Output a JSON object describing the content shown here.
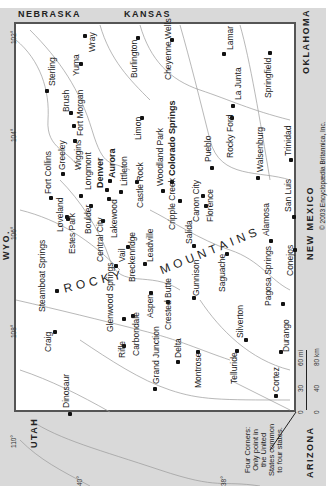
{
  "map": {
    "title": "Colorado",
    "orientation": "rotated 90° counter-clockwise (north at left)",
    "neighbors": {
      "nebraska": "NEBRASKA",
      "kansas": "KANSAS",
      "oklahoma": "OKLAHOMA",
      "new_mexico": "NEW MEXICO",
      "arizona": "ARIZONA",
      "utah": "UTAH",
      "wyoming": "WYO."
    },
    "mountain_range": {
      "word1": "ROCKY",
      "word2": "MOUNTAINS"
    },
    "longitude_ticks": [
      "102°",
      "104°",
      "106°",
      "108°",
      "110°"
    ],
    "latitude_ticks": [
      "38°",
      "40°"
    ],
    "copyright": "© 2003 Encyclopædia Britannica, Inc.",
    "four_corners_note": "Four Corners:\nOnly point in\nthe United\nStates common\nto four states.",
    "scale": {
      "mi_labels": [
        "0",
        "30",
        "60 mi"
      ],
      "km_labels": [
        "0",
        "40",
        "80 km"
      ]
    },
    "cities": [
      {
        "name": "Wray"
      },
      {
        "name": "Yuma"
      },
      {
        "name": "Sterling"
      },
      {
        "name": "Brush"
      },
      {
        "name": "Fort Morgan"
      },
      {
        "name": "Burlington"
      },
      {
        "name": "Cheyenne Wells"
      },
      {
        "name": "Lamar"
      },
      {
        "name": "Springfield"
      },
      {
        "name": "La Junta"
      },
      {
        "name": "Rocky Ford"
      },
      {
        "name": "Trinidad"
      },
      {
        "name": "Walsenburg"
      },
      {
        "name": "Limon"
      },
      {
        "name": "Fort Collins"
      },
      {
        "name": "Greeley"
      },
      {
        "name": "Wiggins"
      },
      {
        "name": "Longmont"
      },
      {
        "name": "Denver"
      },
      {
        "name": "Aurora"
      },
      {
        "name": "Littleton"
      },
      {
        "name": "Loveland"
      },
      {
        "name": "Estes Park"
      },
      {
        "name": "Boulder"
      },
      {
        "name": "Central City"
      },
      {
        "name": "Lakewood"
      },
      {
        "name": "Castle Rock"
      },
      {
        "name": "Woodland Park"
      },
      {
        "name": "Colorado Springs"
      },
      {
        "name": "Pueblo"
      },
      {
        "name": "Canon City"
      },
      {
        "name": "Cripple Creek"
      },
      {
        "name": "Florence"
      },
      {
        "name": "Salida"
      },
      {
        "name": "Breckenridge"
      },
      {
        "name": "Leadville"
      },
      {
        "name": "Vail"
      },
      {
        "name": "Steamboat Springs"
      },
      {
        "name": "Craig"
      },
      {
        "name": "Glenwood Springs"
      },
      {
        "name": "Rifle"
      },
      {
        "name": "Carbondale"
      },
      {
        "name": "Aspen"
      },
      {
        "name": "Crested Butte"
      },
      {
        "name": "Gunnison"
      },
      {
        "name": "Saguache"
      },
      {
        "name": "Alamosa"
      },
      {
        "name": "San Luis"
      },
      {
        "name": "Conejos"
      },
      {
        "name": "Pagosa Springs"
      },
      {
        "name": "Durango"
      },
      {
        "name": "Silverton"
      },
      {
        "name": "Telluride"
      },
      {
        "name": "Montrose"
      },
      {
        "name": "Delta"
      },
      {
        "name": "Grand Junction"
      },
      {
        "name": "Cortez"
      },
      {
        "name": "Dinosaur"
      }
    ]
  }
}
